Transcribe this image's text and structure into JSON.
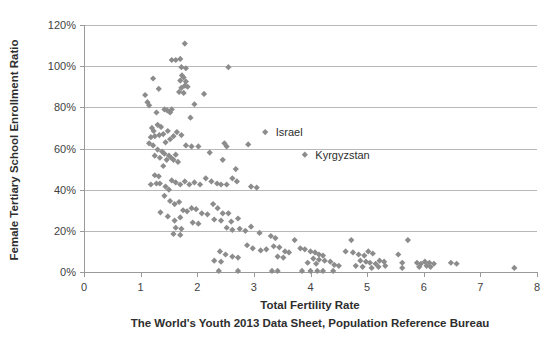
{
  "chart_data": {
    "type": "scatter",
    "title": "",
    "xlabel": "Total Fertility Rate",
    "ylabel": "Female Tertiary School Enrollment Ratio",
    "subtitle": "The World's Youth 2013 Data Sheet, Population Reference Bureau",
    "xlim": [
      0,
      8
    ],
    "ylim": [
      0,
      1.2
    ],
    "xticks": [
      0,
      1,
      2,
      3,
      4,
      5,
      6,
      7,
      8
    ],
    "xtick_labels": [
      "0",
      "1",
      "2",
      "3",
      "4",
      "5",
      "6",
      "7",
      "8"
    ],
    "yticks": [
      0,
      0.2,
      0.4,
      0.6,
      0.8,
      1.0,
      1.2
    ],
    "ytick_labels": [
      "0%",
      "20%",
      "40%",
      "60%",
      "80%",
      "100%",
      "120%"
    ],
    "grid": "horizontal",
    "legend": "none",
    "marker_shape": "diamond",
    "marker_color": "#8c8c8c",
    "gridline_color": "#b8b8b8",
    "axis_color": "#9a9a9a",
    "background_color": "#ffffff",
    "annotations": [
      {
        "label": "Israel",
        "x": 3.2,
        "y": 0.68,
        "marker_x": 3.2,
        "marker_y": 0.68,
        "label_x": 3.35,
        "label_y": 0.68
      },
      {
        "label": "Kyrgyzstan",
        "x": 3.9,
        "y": 0.57,
        "marker_x": 3.9,
        "marker_y": 0.57,
        "label_x": 4.05,
        "label_y": 0.57
      }
    ],
    "series": [
      {
        "name": "Countries",
        "points": [
          [
            1.22,
            0.94
          ],
          [
            1.08,
            0.86
          ],
          [
            1.12,
            0.825
          ],
          [
            1.15,
            0.81
          ],
          [
            1.32,
            0.89
          ],
          [
            1.28,
            0.775
          ],
          [
            1.42,
            0.79
          ],
          [
            1.47,
            0.785
          ],
          [
            1.55,
            1.03
          ],
          [
            1.62,
            1.03
          ],
          [
            1.7,
            1.035
          ],
          [
            1.78,
            1.11
          ],
          [
            1.72,
            0.995
          ],
          [
            1.8,
            0.99
          ],
          [
            1.73,
            0.955
          ],
          [
            1.76,
            0.945
          ],
          [
            1.7,
            0.93
          ],
          [
            1.8,
            0.925
          ],
          [
            1.78,
            0.905
          ],
          [
            1.72,
            0.895
          ],
          [
            1.83,
            0.9
          ],
          [
            1.68,
            0.875
          ],
          [
            1.76,
            0.87
          ],
          [
            1.95,
            0.815
          ],
          [
            1.88,
            0.75
          ],
          [
            2.12,
            0.865
          ],
          [
            2.55,
            0.995
          ],
          [
            1.52,
            0.775
          ],
          [
            1.55,
            0.79
          ],
          [
            1.2,
            0.7
          ],
          [
            1.23,
            0.685
          ],
          [
            1.3,
            0.715
          ],
          [
            1.36,
            0.705
          ],
          [
            1.25,
            0.66
          ],
          [
            1.33,
            0.665
          ],
          [
            1.18,
            0.655
          ],
          [
            1.4,
            0.67
          ],
          [
            1.48,
            0.685
          ],
          [
            1.52,
            0.645
          ],
          [
            1.44,
            0.63
          ],
          [
            1.15,
            0.625
          ],
          [
            1.22,
            0.615
          ],
          [
            1.58,
            0.66
          ],
          [
            1.64,
            0.68
          ],
          [
            1.72,
            0.665
          ],
          [
            1.8,
            0.615
          ],
          [
            1.9,
            0.61
          ],
          [
            2.02,
            0.61
          ],
          [
            1.3,
            0.595
          ],
          [
            1.38,
            0.585
          ],
          [
            1.42,
            0.575
          ],
          [
            1.25,
            0.565
          ],
          [
            1.34,
            0.555
          ],
          [
            1.46,
            0.545
          ],
          [
            1.5,
            0.565
          ],
          [
            1.54,
            0.555
          ],
          [
            1.58,
            0.545
          ],
          [
            1.62,
            0.57
          ],
          [
            1.66,
            0.535
          ],
          [
            1.4,
            0.515
          ],
          [
            2.22,
            0.58
          ],
          [
            2.45,
            0.545
          ],
          [
            2.68,
            0.5
          ],
          [
            2.95,
            0.415
          ],
          [
            3.05,
            0.41
          ],
          [
            1.28,
            0.43
          ],
          [
            1.34,
            0.43
          ],
          [
            1.18,
            0.425
          ],
          [
            1.55,
            0.445
          ],
          [
            1.62,
            0.435
          ],
          [
            1.7,
            0.425
          ],
          [
            1.78,
            0.44
          ],
          [
            1.86,
            0.425
          ],
          [
            1.95,
            0.435
          ],
          [
            2.05,
            0.425
          ],
          [
            2.15,
            0.455
          ],
          [
            2.25,
            0.44
          ],
          [
            2.35,
            0.43
          ],
          [
            2.42,
            0.425
          ],
          [
            2.52,
            0.425
          ],
          [
            2.62,
            0.455
          ],
          [
            2.7,
            0.44
          ],
          [
            1.44,
            0.415
          ],
          [
            1.5,
            0.4
          ],
          [
            1.42,
            0.37
          ],
          [
            1.52,
            0.345
          ],
          [
            1.6,
            0.33
          ],
          [
            1.68,
            0.34
          ],
          [
            1.75,
            0.3
          ],
          [
            1.82,
            0.295
          ],
          [
            1.9,
            0.31
          ],
          [
            1.98,
            0.305
          ],
          [
            2.08,
            0.285
          ],
          [
            2.18,
            0.28
          ],
          [
            2.28,
            0.33
          ],
          [
            2.36,
            0.31
          ],
          [
            2.45,
            0.285
          ],
          [
            2.55,
            0.285
          ],
          [
            2.3,
            0.255
          ],
          [
            2.42,
            0.25
          ],
          [
            2.6,
            0.245
          ],
          [
            2.72,
            0.26
          ],
          [
            2.52,
            0.215
          ],
          [
            2.62,
            0.205
          ],
          [
            2.75,
            0.21
          ],
          [
            2.85,
            0.2
          ],
          [
            1.92,
            0.24
          ],
          [
            2.02,
            0.235
          ],
          [
            1.7,
            0.265
          ],
          [
            1.6,
            0.25
          ],
          [
            1.48,
            0.27
          ],
          [
            1.35,
            0.29
          ],
          [
            1.62,
            0.215
          ],
          [
            1.72,
            0.21
          ],
          [
            1.58,
            0.185
          ],
          [
            1.7,
            0.18
          ],
          [
            2.95,
            0.22
          ],
          [
            3.1,
            0.19
          ],
          [
            3.3,
            0.175
          ],
          [
            3.38,
            0.165
          ],
          [
            2.88,
            0.13
          ],
          [
            2.98,
            0.115
          ],
          [
            3.12,
            0.105
          ],
          [
            3.22,
            0.11
          ],
          [
            3.35,
            0.125
          ],
          [
            3.45,
            0.12
          ],
          [
            3.55,
            0.1
          ],
          [
            3.62,
            0.095
          ],
          [
            3.42,
            0.075
          ],
          [
            3.52,
            0.07
          ],
          [
            2.4,
            0.1
          ],
          [
            2.5,
            0.085
          ],
          [
            2.62,
            0.075
          ],
          [
            2.72,
            0.07
          ],
          [
            2.3,
            0.055
          ],
          [
            2.42,
            0.05
          ],
          [
            3.72,
            0.155
          ],
          [
            3.82,
            0.115
          ],
          [
            3.9,
            0.11
          ],
          [
            4.0,
            0.1
          ],
          [
            4.08,
            0.095
          ],
          [
            4.15,
            0.085
          ],
          [
            4.22,
            0.08
          ],
          [
            4.05,
            0.065
          ],
          [
            4.15,
            0.06
          ],
          [
            4.25,
            0.055
          ],
          [
            4.35,
            0.05
          ],
          [
            4.42,
            0.035
          ],
          [
            4.5,
            0.03
          ],
          [
            3.95,
            0.045
          ],
          [
            4.1,
            0.04
          ],
          [
            4.72,
            0.155
          ],
          [
            4.62,
            0.1
          ],
          [
            4.75,
            0.095
          ],
          [
            4.85,
            0.085
          ],
          [
            4.95,
            0.08
          ],
          [
            5.02,
            0.1
          ],
          [
            5.1,
            0.09
          ],
          [
            4.88,
            0.055
          ],
          [
            4.98,
            0.05
          ],
          [
            5.05,
            0.045
          ],
          [
            5.15,
            0.04
          ],
          [
            5.22,
            0.055
          ],
          [
            5.3,
            0.05
          ],
          [
            4.8,
            0.03
          ],
          [
            4.92,
            0.025
          ],
          [
            5.08,
            0.02
          ],
          [
            5.2,
            0.025
          ],
          [
            5.32,
            0.03
          ],
          [
            5.55,
            0.085
          ],
          [
            5.62,
            0.045
          ],
          [
            5.62,
            0.02
          ],
          [
            5.72,
            0.155
          ],
          [
            5.88,
            0.045
          ],
          [
            5.95,
            0.04
          ],
          [
            6.02,
            0.05
          ],
          [
            6.1,
            0.045
          ],
          [
            6.18,
            0.04
          ],
          [
            6.05,
            0.03
          ],
          [
            5.92,
            0.025
          ],
          [
            6.12,
            0.025
          ],
          [
            6.48,
            0.045
          ],
          [
            6.58,
            0.04
          ],
          [
            7.6,
            0.02
          ],
          [
            2.38,
            0.005
          ],
          [
            2.72,
            0.005
          ],
          [
            3.32,
            0.005
          ],
          [
            3.42,
            0.005
          ],
          [
            3.85,
            0.005
          ],
          [
            4.0,
            0.005
          ],
          [
            4.12,
            0.005
          ],
          [
            4.22,
            0.005
          ],
          [
            4.4,
            0.005
          ],
          [
            2.48,
            0.625
          ],
          [
            2.52,
            0.61
          ],
          [
            2.9,
            0.62
          ],
          [
            1.25,
            0.47
          ],
          [
            1.32,
            0.465
          ]
        ]
      }
    ]
  },
  "plot_geometry": {
    "left": 84,
    "right": 537,
    "top": 25,
    "bottom": 272
  }
}
